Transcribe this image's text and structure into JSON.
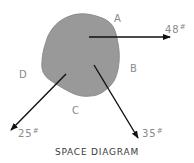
{
  "diagram": {
    "title": "SPACE DIAGRAM",
    "body": {
      "shape": "irregular-blob",
      "fill": "#999999",
      "outline": "#8c8c8c"
    },
    "region_labels": {
      "A": "A",
      "B": "B",
      "C": "C",
      "D": "D"
    },
    "forces": [
      {
        "id": "right",
        "magnitude": "48",
        "unit_symbol": "#",
        "direction": "right (horizontal)"
      },
      {
        "id": "down-right",
        "magnitude": "35",
        "unit_symbol": "#",
        "direction": "down-right"
      },
      {
        "id": "down-left",
        "magnitude": "25",
        "unit_symbol": "#",
        "direction": "down-left"
      }
    ],
    "colors": {
      "arrow": "#111111",
      "label": "#8a8a8a",
      "title": "#3a3a3a"
    }
  }
}
